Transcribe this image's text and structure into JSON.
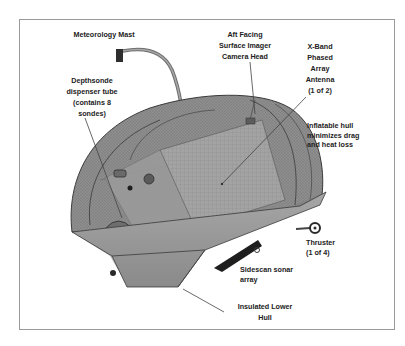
{
  "figure": {
    "type": "annotated-vehicle-diagram",
    "colors": {
      "border": "#9a9a9a",
      "hull_fill": "#8c8c8c",
      "hull_dark": "#5a5a5a",
      "lower_hull": "#9b9b9b",
      "label_text": "#222222",
      "leader_line": "#444444"
    },
    "labels": {
      "meteorology_mast": {
        "lines": [
          "Meteorology Mast"
        ]
      },
      "aft_camera": {
        "lines": [
          "Aft Facing",
          "Surface Imager",
          "Camera Head"
        ]
      },
      "xband_antenna": {
        "lines": [
          "X-Band",
          "Phased",
          "Array",
          "Antenna",
          "(1 of 2)"
        ]
      },
      "depthsonde": {
        "lines": [
          "Depthsonde",
          "dispenser tube",
          "(contains 8",
          "sondes)"
        ]
      },
      "inflatable_hull": {
        "lines": [
          "Inflatable hull",
          "minimizes drag",
          "and heat loss"
        ]
      },
      "thruster": {
        "lines": [
          "Thruster",
          "(1 of 4)"
        ]
      },
      "sidescan_sonar": {
        "lines": [
          "Sidescan sonar",
          "array"
        ]
      },
      "lower_hull": {
        "lines": [
          "Insulated Lower",
          "Hull"
        ]
      }
    }
  }
}
